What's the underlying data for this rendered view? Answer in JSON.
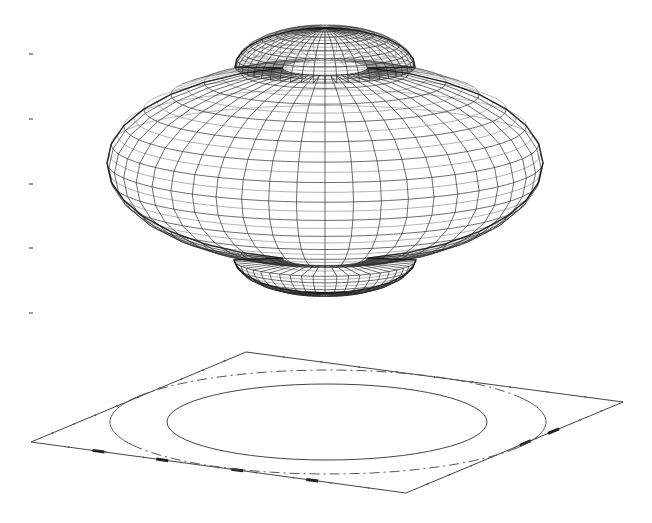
{
  "chart_data": {
    "type": "surface3d",
    "title": "",
    "xlabel": "",
    "ylabel": "",
    "zlabel": "",
    "z_ticks": {
      "count": 5,
      "labels": [
        "",
        "",
        "",
        "",
        ""
      ],
      "pixel_y": [
        54,
        119,
        184,
        248,
        313
      ],
      "pixel_x": 31
    },
    "surface": {
      "description": "Wireframe 3D surface: oblate torus-like body with a raised central dome on top and a smaller lobe underneath",
      "mesh_color": "#2a2a2a",
      "center_x": 325,
      "body": {
        "center_y": 163,
        "half_width": 218,
        "half_height": 97,
        "top_y": 67,
        "bottom_y": 260
      },
      "top_dome": {
        "left_x": 233,
        "right_x": 413,
        "base_y": 67,
        "peak_y": 28
      },
      "bottom_lobe": {
        "left_x": 238,
        "right_x": 420,
        "base_y": 258,
        "bottom_y": 293
      },
      "meridians": 48,
      "parallels": 26
    },
    "contour_plane": {
      "vertices": [
        [
          31,
          442
        ],
        [
          246,
          352
        ],
        [
          623,
          402
        ],
        [
          406,
          493
        ]
      ],
      "stroke": "#444444"
    },
    "contours": [
      {
        "name": "inner",
        "style": "solid",
        "cx": 327,
        "cy": 422,
        "rx": 160,
        "ry": 38
      },
      {
        "name": "outer",
        "style": "solid-sides-dashdot-top-bottom",
        "cx": 328,
        "cy": 422,
        "rx": 218,
        "ry": 52
      }
    ]
  }
}
